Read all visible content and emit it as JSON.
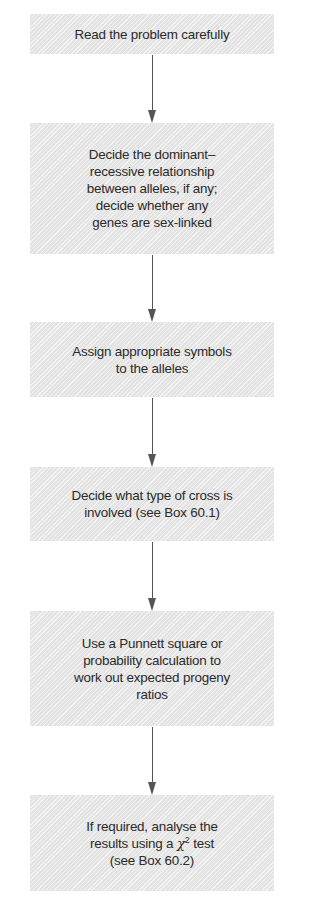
{
  "flowchart": {
    "steps": [
      {
        "id": "read-problem",
        "lines": [
          "Read the problem carefully"
        ]
      },
      {
        "id": "dominance-relationship",
        "lines": [
          "Decide the dominant–",
          "recessive relationship",
          "between alleles, if any;",
          "decide whether any",
          "genes are sex-linked"
        ]
      },
      {
        "id": "assign-symbols",
        "lines": [
          "Assign appropriate symbols",
          "to the alleles"
        ]
      },
      {
        "id": "cross-type",
        "lines": [
          "Decide what type of cross is",
          "involved (see Box 60.1)"
        ]
      },
      {
        "id": "punnett-square",
        "lines": [
          "Use a Punnett square or",
          "probability calculation to",
          "work out expected progeny",
          "ratios"
        ]
      },
      {
        "id": "chi-square-test",
        "lines": [
          "If required, analyse the",
          "results using a",
          "(see Box 60.2)"
        ],
        "chi_symbol": "χ",
        "chi_superscript": "2",
        "chi_suffix": " test"
      }
    ],
    "colors": {
      "box_fill": "#e3e3e3",
      "text": "#2a2a2a",
      "arrow": "#555555"
    }
  }
}
